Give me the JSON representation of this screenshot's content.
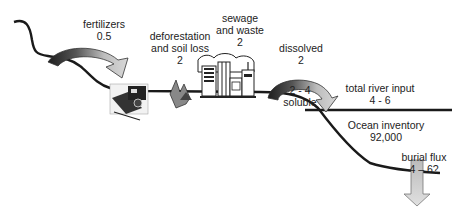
{
  "diagram": {
    "type": "flux-cycle",
    "labels": {
      "fertilizers": {
        "name": "fertilizers",
        "value": "0.5"
      },
      "deforestation": {
        "name_line1": "deforestation",
        "name_line2": "and soil loss",
        "value": "2"
      },
      "sewage": {
        "name_line1": "sewage",
        "name_line2": "and waste",
        "value": "2"
      },
      "dissolved": {
        "name": "dissolved",
        "value": "2"
      },
      "soluble": {
        "value": "2 - 4",
        "name": "soluble"
      },
      "river_input": {
        "name": "total river input",
        "value": "4 - 6"
      },
      "ocean": {
        "name": "Ocean inventory",
        "value": "92,000"
      },
      "burial": {
        "name": "burial flux",
        "value": "4 – 6?"
      }
    },
    "icons": [
      "tractor-icon",
      "forest-fire-icon",
      "city-icon"
    ],
    "colors": {
      "line": "#1a1a1a",
      "arrow_dark": "#2a2a2a",
      "arrow_light": "#c8c8c8"
    }
  }
}
